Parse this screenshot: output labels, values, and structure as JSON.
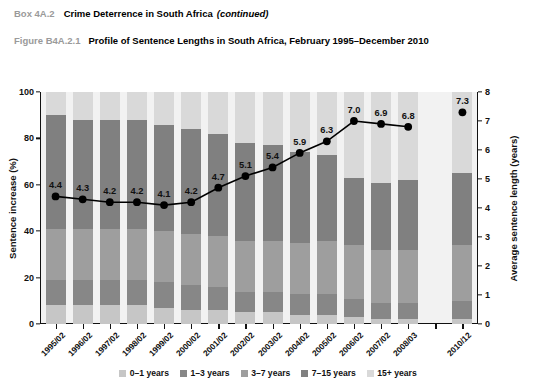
{
  "header": {
    "box_tag": "Box 4A.2",
    "box_title": "Crime Deterrence in South Africa",
    "box_continued": "(continued)",
    "figure_tag": "Figure B4A.2.1",
    "figure_title": "Profile of Sentence Lengths in South Africa, February 1995–December 2010"
  },
  "chart_data": {
    "type": "bar",
    "title": "Profile of Sentence Lengths in South Africa, February 1995–December 2010",
    "xlabel": "",
    "ylabel": "Sentence increase (%)",
    "y2label": "Average sentence length (years)",
    "ylim": [
      0,
      100
    ],
    "y2lim": [
      0,
      8
    ],
    "yticks": [
      0,
      20,
      40,
      60,
      80,
      100
    ],
    "y2ticks": [
      0,
      1,
      2,
      3,
      4,
      5,
      6,
      7,
      8
    ],
    "grid": false,
    "legend_position": "bottom",
    "categories": [
      "1995/02",
      "1996/02",
      "1997/02",
      "1998/02",
      "1999/02",
      "2000/02",
      "2001/02",
      "2002/02",
      "2003/02",
      "2004/02",
      "2005/02",
      "2006/02",
      "2007/02",
      "2008/03",
      "",
      "2010/12"
    ],
    "series": [
      {
        "name": "0–1 years",
        "color": "#c6c6c6",
        "values": [
          8,
          8,
          8,
          8,
          7,
          6,
          6,
          5,
          5,
          4,
          4,
          3,
          2,
          2,
          null,
          2
        ]
      },
      {
        "name": "1–3 years",
        "color": "#878787",
        "values": [
          11,
          11,
          11,
          11,
          11,
          11,
          10,
          9,
          9,
          9,
          9,
          8,
          7,
          7,
          null,
          8
        ]
      },
      {
        "name": "3–7 years",
        "color": "#9e9e9e",
        "values": [
          22,
          22,
          22,
          22,
          22,
          22,
          22,
          22,
          22,
          22,
          23,
          23,
          23,
          23,
          null,
          24
        ]
      },
      {
        "name": "7–15 years",
        "color": "#808080",
        "values": [
          49,
          47,
          47,
          47,
          46,
          45,
          44,
          42,
          41,
          39,
          37,
          29,
          29,
          30,
          null,
          31
        ]
      },
      {
        "name": "15+ years",
        "color": "#d9d9d9",
        "values": [
          10,
          12,
          12,
          12,
          14,
          16,
          18,
          22,
          23,
          26,
          27,
          37,
          39,
          38,
          null,
          35
        ]
      }
    ],
    "line_series": {
      "name": "Average sentence length (years)",
      "color": "#000000",
      "axis": "right",
      "labels": [
        "4.4",
        "4.3",
        "4.2",
        "4.2",
        "4.1",
        "4.2",
        "4.7",
        "5.1",
        "5.4",
        "5.9",
        "6.3",
        "7.0",
        "6.9",
        "6.8",
        "",
        "7.3"
      ],
      "values": [
        4.4,
        4.3,
        4.2,
        4.2,
        4.1,
        4.2,
        4.7,
        5.1,
        5.4,
        5.9,
        6.3,
        7.0,
        6.9,
        6.8,
        null,
        7.3
      ]
    }
  },
  "legend": {
    "items": [
      {
        "label": "0–1 years",
        "color": "#c6c6c6"
      },
      {
        "label": "1–3 years",
        "color": "#878787"
      },
      {
        "label": "3–7 years",
        "color": "#9e9e9e"
      },
      {
        "label": "7–15 years",
        "color": "#808080"
      },
      {
        "label": "15+ years",
        "color": "#d9d9d9"
      }
    ]
  }
}
